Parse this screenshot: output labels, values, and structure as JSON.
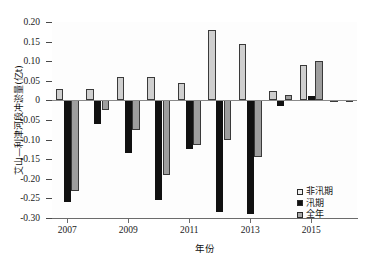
{
  "chart_data": {
    "type": "bar",
    "title": "",
    "xlabel": "年份",
    "ylabel": "艾山—利津河段冲淤量(亿t)",
    "categories": [
      "2007",
      "2008",
      "2009",
      "2010",
      "2011",
      "2012",
      "2013",
      "2014",
      "2015",
      "2016"
    ],
    "xtick_labels": [
      "2007",
      "2009",
      "2011",
      "2013",
      "2015"
    ],
    "ytick_labels": [
      "0.20",
      "0.15",
      "0.10",
      "0.05",
      "0",
      "-0.05",
      "-0.10",
      "-0.15",
      "-0.20",
      "-0.25",
      "-0.30"
    ],
    "ytick_values": [
      0.2,
      0.15,
      0.1,
      0.05,
      0,
      -0.05,
      -0.1,
      -0.15,
      -0.2,
      -0.25,
      -0.3
    ],
    "ylim": [
      -0.3,
      0.2
    ],
    "grid": false,
    "legend_position": "bottom-right",
    "series": [
      {
        "name": "非汛期",
        "color": "#cfcfcf",
        "values": [
          0.03,
          0.03,
          0.06,
          0.06,
          0.045,
          0.18,
          0.145,
          0.025,
          0.09,
          0.002
        ]
      },
      {
        "name": "汛期",
        "color": "#111111",
        "values": [
          -0.26,
          -0.06,
          -0.135,
          -0.255,
          -0.125,
          -0.285,
          -0.29,
          -0.015,
          0.01,
          0.0
        ]
      },
      {
        "name": "全年",
        "color": "#9e9e9e",
        "values": [
          -0.23,
          -0.025,
          -0.075,
          -0.19,
          -0.115,
          -0.1,
          -0.145,
          0.015,
          0.1,
          -0.005
        ]
      }
    ]
  },
  "legend": {
    "items": [
      {
        "label": "非汛期",
        "swatch": "light-gray-square"
      },
      {
        "label": "汛期",
        "swatch": "black-square"
      },
      {
        "label": "全年",
        "swatch": "gray-square"
      }
    ]
  }
}
